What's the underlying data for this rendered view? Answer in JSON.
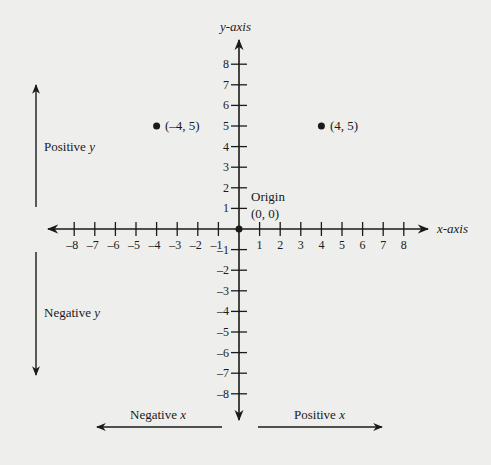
{
  "diagram": {
    "type": "coordinate-plane",
    "axes": {
      "x_label": "x-axis",
      "y_label": "y-axis",
      "x_ticks": [
        -8,
        -7,
        -6,
        -5,
        -4,
        -3,
        -2,
        -1,
        1,
        2,
        3,
        4,
        5,
        6,
        7,
        8
      ],
      "y_ticks": [
        8,
        7,
        6,
        5,
        4,
        3,
        2,
        1,
        -1,
        -2,
        -3,
        -4,
        -5,
        -6,
        -7,
        -8
      ]
    },
    "origin": {
      "label": "Origin",
      "coords": "(0, 0)"
    },
    "points": [
      {
        "x": -4,
        "y": 5,
        "label": "(–4, 5)"
      },
      {
        "x": 4,
        "y": 5,
        "label": "(4, 5)"
      }
    ],
    "direction_labels": {
      "positive_y": {
        "word": "Positive",
        "var": "y"
      },
      "negative_y": {
        "word": "Negative",
        "var": "y"
      },
      "negative_x": {
        "word": "Negative",
        "var": "x"
      },
      "positive_x": {
        "word": "Positive",
        "var": "x"
      }
    },
    "colors": {
      "background": "#eeeeec",
      "ink": "#1a1a1a"
    }
  }
}
